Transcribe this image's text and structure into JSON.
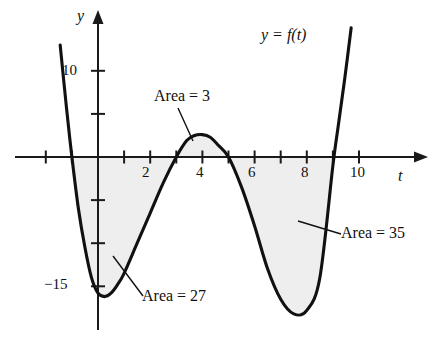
{
  "figure": {
    "kind": "graph-of-function",
    "background": "#ffffff",
    "curve_color": "#111111",
    "shade_color": "#eeeeee",
    "axis_color": "#1a1a1a"
  },
  "axes": {
    "x_axis_name": "t",
    "y_axis_name": "y",
    "x_tick_labels": [
      {
        "value": 2,
        "text": "2"
      },
      {
        "value": 4,
        "text": "4"
      },
      {
        "value": 6,
        "text": "6"
      },
      {
        "value": 8,
        "text": "8"
      },
      {
        "value": 10,
        "text": "10"
      }
    ],
    "y_tick_labels": [
      {
        "value": 10,
        "text": "10"
      },
      {
        "value": -15,
        "text": "−15"
      }
    ]
  },
  "annotations": {
    "function_label": "y = f(t)",
    "area_middle": "Area = 3",
    "area_left": "Area = 27",
    "area_right": "Area = 35"
  },
  "chart_data": {
    "type": "line",
    "title": "",
    "xlabel": "t",
    "ylabel": "y",
    "xlim": [
      -2.2,
      11.0
    ],
    "ylim": [
      -19.5,
      13.5
    ],
    "grid": false,
    "legend": "none",
    "xticks": [
      -2,
      -1,
      0,
      1,
      2,
      3,
      4,
      5,
      6,
      7,
      8,
      9,
      10
    ],
    "xticklabels": [
      "",
      "",
      "",
      "",
      "2",
      "",
      "4",
      "",
      "6",
      "",
      "8",
      "",
      "10"
    ],
    "yticks": [
      10,
      5,
      0,
      -5,
      -10,
      -15
    ],
    "yticklabels": [
      "10",
      "",
      "",
      "",
      "",
      "−15"
    ],
    "series": [
      {
        "name": "y = f(t)",
        "x": [
          -1.45,
          -1.2,
          -1.0,
          -0.75,
          -0.5,
          -0.25,
          0.0,
          0.25,
          0.5,
          0.75,
          1.0,
          1.5,
          2.0,
          2.5,
          3.0,
          3.4,
          3.7,
          4.0,
          4.3,
          4.6,
          5.0,
          5.5,
          6.0,
          6.5,
          7.0,
          7.5,
          8.0,
          8.5,
          9.0,
          9.2,
          9.45,
          9.7
        ],
        "y": [
          13.0,
          5.5,
          0.0,
          -6.0,
          -10.5,
          -14.0,
          -15.8,
          -16.2,
          -15.8,
          -14.8,
          -13.5,
          -10.0,
          -6.5,
          -3.0,
          0.0,
          1.9,
          2.5,
          2.6,
          2.3,
          1.4,
          0.0,
          -3.5,
          -8.0,
          -13.0,
          -16.5,
          -18.2,
          -17.8,
          -14.0,
          -1.0,
          3.5,
          9.0,
          15.0
        ]
      }
    ],
    "shaded_regions": [
      {
        "label": "Area = 27",
        "from": -1.0,
        "to": 3.0,
        "value": 27,
        "side": "below-axis"
      },
      {
        "label": "Area = 3",
        "from": 3.0,
        "to": 5.0,
        "value": 3,
        "side": "above-axis"
      },
      {
        "label": "Area = 35",
        "from": 5.0,
        "to": 9.05,
        "value": 35,
        "side": "below-axis"
      }
    ]
  }
}
